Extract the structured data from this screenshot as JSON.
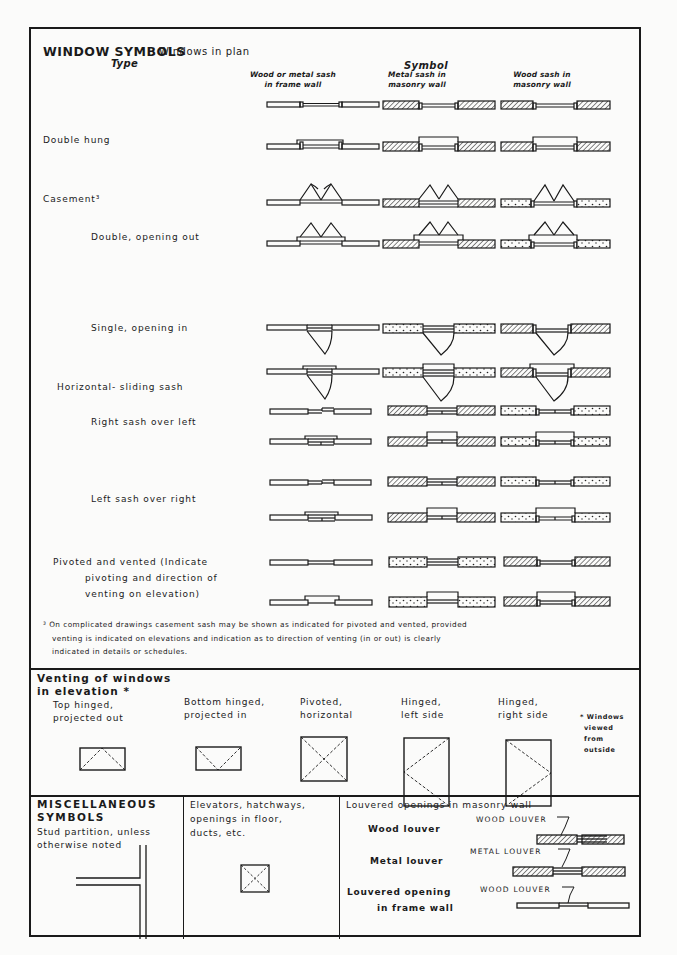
{
  "header": {
    "title": "WINDOW SYMBOLS",
    "subtitle": "Windows in plan",
    "type_heading": "Type",
    "symbol_heading": "Symbol",
    "columns": [
      {
        "line1": "Wood or metal sash",
        "line2": "in frame wall"
      },
      {
        "line1": "Metal sash in",
        "line2": "masonry wall"
      },
      {
        "line1": "Wood sash in",
        "line2": "masonry wall"
      }
    ]
  },
  "window_types": [
    {
      "label": "Double hung"
    },
    {
      "label": "Casement³"
    },
    {
      "label": "Double, opening out"
    },
    {
      "label": "Single, opening in"
    },
    {
      "label": "Horizontal- sliding sash"
    },
    {
      "label": "Right sash over left"
    },
    {
      "label": "Left sash over right"
    },
    {
      "label": "Pivoted and vented (Indicate",
      "line2": "pivoting and direction of",
      "line3": "venting on elevation)"
    }
  ],
  "footnote": {
    "marker": "³",
    "line1": "On complicated drawings casement sash may be shown as indicated for pivoted and vented, provided",
    "line2": "venting is indicated on elevations and indication as to direction of venting (in or out) is clearly",
    "line3": "indicated in details or schedules."
  },
  "venting": {
    "title_line1": "Venting of windows",
    "title_line2": "in elevation *",
    "items": [
      {
        "line1": "Top hinged,",
        "line2": "projected out"
      },
      {
        "line1": "Bottom hinged,",
        "line2": "projected in"
      },
      {
        "line1": "Pivoted,",
        "line2": "horizontal"
      },
      {
        "line1": "Hinged,",
        "line2": "left side"
      },
      {
        "line1": "Hinged,",
        "line2": "right side"
      }
    ],
    "note": [
      "* Windows",
      "viewed",
      "from",
      "outside"
    ]
  },
  "misc": {
    "title_line1": "MISCELLANEOUS",
    "title_line2": "SYMBOLS",
    "stud_line1": "Stud partition, unless",
    "stud_line2": "otherwise noted",
    "elev_line1": "Elevators, hatchways,",
    "elev_line2": "openings in floor,",
    "elev_line3": "ducts, etc.",
    "louver_title": "Louvered openings in masonry wall",
    "wood_louver": "Wood louver",
    "metal_louver": "Metal louver",
    "frame_line1": "Louvered opening",
    "frame_line2": "in frame wall",
    "tag_wood": "WOOD LOUVER",
    "tag_metal": "METAL LOUVER",
    "tag_wood2": "WOOD LOUVER"
  }
}
